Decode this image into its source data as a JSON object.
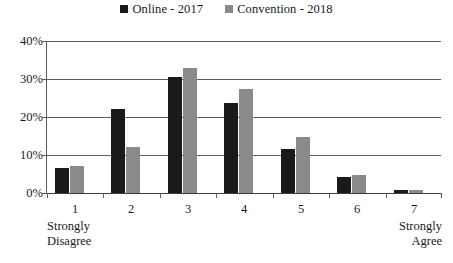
{
  "chart_data": {
    "type": "bar",
    "title": "",
    "subtitle": "",
    "xlabel": "",
    "ylabel": "",
    "categories": [
      "1",
      "2",
      "3",
      "4",
      "5",
      "6",
      "7"
    ],
    "category_notes": [
      "Strongly\nDisagree",
      "",
      "",
      "",
      "",
      "",
      "Strongly\nAgree"
    ],
    "series": [
      {
        "name": "Online - 2017",
        "color": "#1a1a1a",
        "values": [
          6.7,
          22.0,
          30.4,
          23.8,
          11.5,
          4.2,
          0.7
        ]
      },
      {
        "name": "Convention - 2018",
        "color": "#8a8a8a",
        "values": [
          7.2,
          12.0,
          32.8,
          27.5,
          14.8,
          4.8,
          0.9
        ]
      }
    ],
    "ylim": [
      0,
      40
    ],
    "y_ticks": [
      "0%",
      "10%",
      "20%",
      "30%",
      "40%"
    ],
    "y_tick_values": [
      0,
      10,
      20,
      30,
      40
    ],
    "grid": true,
    "legend_position": "top-center"
  },
  "legend": {
    "entries": [
      {
        "label": "Online - 2017",
        "swatch": "#1a1a1a"
      },
      {
        "label": "Convention - 2018",
        "swatch": "#8a8a8a"
      }
    ]
  },
  "colors": {
    "series_a": "#1a1a1a",
    "series_b": "#8a8a8a",
    "axis": "#5c5c5c",
    "grid": "#5c5c5c",
    "background": "#ffffff",
    "text": "#1a1a1a"
  }
}
